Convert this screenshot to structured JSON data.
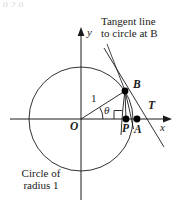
{
  "figure": {
    "title_lines": [
      "Tangent line",
      "to circle at B"
    ],
    "caption_lines": [
      "Circle of",
      "radius 1"
    ],
    "top_artifact": "0.2 0",
    "axis_labels": {
      "x": "x",
      "y": "y"
    },
    "point_labels": {
      "origin": "O",
      "b": "B",
      "p": "P",
      "a": "A",
      "t": "T"
    },
    "radius_label": "1",
    "angle_label": "θ",
    "colors": {
      "stroke": "#1a1a1a",
      "background": "#ffffff",
      "point_fill": "#000000"
    },
    "geometry": {
      "center": [
        81,
        119
      ],
      "radius": 52,
      "theta_degrees": 32,
      "x_axis": {
        "x1": 10,
        "x2": 172,
        "y": 119
      },
      "y_axis": {
        "x": 81,
        "y1": 28,
        "y2": 200
      },
      "point_b": [
        125,
        91
      ],
      "point_p": [
        126,
        119
      ],
      "point_a": [
        136,
        119
      ],
      "point_t": [
        146,
        119
      ]
    }
  }
}
